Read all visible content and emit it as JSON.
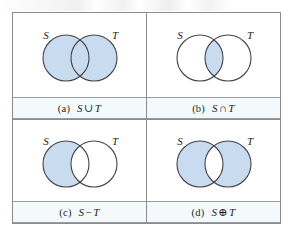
{
  "figure": {
    "type": "venn-diagram-grid",
    "rows": 2,
    "columns": 2,
    "set_labels": {
      "left": "S",
      "right": "T"
    },
    "colors": {
      "shade_fill": "#c9dcef",
      "circle_stroke": "#43434a",
      "frame_border": "#8a8a90",
      "caption_band_bg": "#f4fafc",
      "caption_band_rule": "#9b9b9f",
      "panel_bg": "#ffffff",
      "text": "#1d1d21"
    },
    "panels": [
      {
        "id": "panel-a",
        "tag": "(a)",
        "expression": "S ∪ T",
        "expr_left": "S",
        "expr_op": "∪",
        "expr_right": "T",
        "operation": "union",
        "label_left": "S",
        "label_right": "T",
        "shaded_regions": [
          "left-only",
          "intersection",
          "right-only"
        ]
      },
      {
        "id": "panel-b",
        "tag": "(b)",
        "expression": "S ∩ T",
        "expr_left": "S",
        "expr_op": "∩",
        "expr_right": "T",
        "operation": "intersection",
        "label_left": "S",
        "label_right": "T",
        "shaded_regions": [
          "intersection"
        ]
      },
      {
        "id": "panel-c",
        "tag": "(c)",
        "expression": "S − T",
        "expr_left": "S",
        "expr_op": "−",
        "expr_right": "T",
        "operation": "difference",
        "label_left": "S",
        "label_right": "T",
        "shaded_regions": [
          "left-only"
        ]
      },
      {
        "id": "panel-d",
        "tag": "(d)",
        "expression": "S ⊕ T",
        "expr_left": "S",
        "expr_op": "⊕",
        "expr_right": "T",
        "operation": "symmetric-difference",
        "label_left": "S",
        "label_right": "T",
        "shaded_regions": [
          "left-only",
          "right-only"
        ]
      }
    ]
  }
}
